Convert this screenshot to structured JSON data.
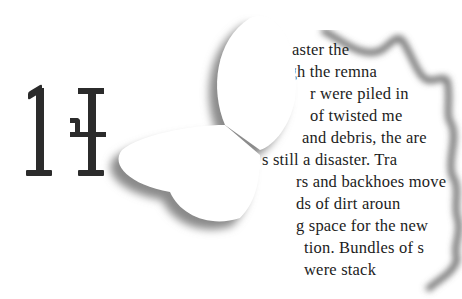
{
  "chapter": {
    "number": "14",
    "digits": [
      "1",
      "4"
    ]
  },
  "decoration": {
    "shape": "butterfly-cutout",
    "shadow_color": "#8a8a8a",
    "paper_edge": "torn"
  },
  "excerpt": {
    "lines": [
      {
        "text": "aster  the",
        "x": 30,
        "y": 22
      },
      {
        "text": "ugh  the  remna",
        "x": 18,
        "y": 45
      },
      {
        "text": "r  were  piled  in",
        "x": 48,
        "y": 67
      },
      {
        "text": "of  twisted  me",
        "x": 48,
        "y": 89
      },
      {
        "text": "and debris, the are",
        "x": 40,
        "y": 111
      },
      {
        "text": "s  still  a  disaster.  Tra",
        "x": 0,
        "y": 133
      },
      {
        "text": "rs and backhoes move",
        "x": 34,
        "y": 155
      },
      {
        "text": "ds   of   dirt   aroun",
        "x": 34,
        "y": 177
      },
      {
        "text": "g  space  for  the  new",
        "x": 34,
        "y": 199
      },
      {
        "text": "tion. Bundles of s",
        "x": 42,
        "y": 221
      },
      {
        "text": "were  stack",
        "x": 42,
        "y": 243
      }
    ]
  }
}
